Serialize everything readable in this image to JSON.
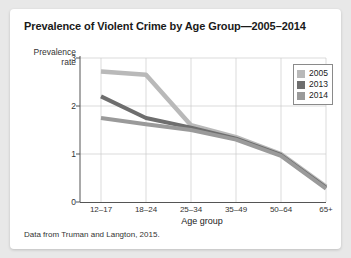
{
  "card": {
    "background": "#ffffff",
    "page_background": "#e8e8e8"
  },
  "title": "Prevalence of Violent Crime by Age Group—2005–2014",
  "source_note": "Data from Truman and Langton, 2015.",
  "axis": {
    "y_title_line1": "Prevalence",
    "y_title_line2": "rate",
    "x_title": "Age group",
    "y_ticks": [
      "0",
      "1",
      "2",
      "3"
    ],
    "x_ticks": [
      "12–17",
      "18–24",
      "25–34",
      "35–49",
      "50–64",
      "65+"
    ]
  },
  "legend": {
    "position": "top-right",
    "entries": [
      {
        "label": "2005",
        "color": "#b9b9b9"
      },
      {
        "label": "2013",
        "color": "#6e6e6e"
      },
      {
        "label": "2014",
        "color": "#9a9a9a"
      }
    ]
  },
  "chart_data": {
    "type": "line",
    "title": "Prevalence of Violent Crime by Age Group—2005–2014",
    "xlabel": "Age group",
    "ylabel": "Prevalence rate",
    "categories": [
      "12–17",
      "18–24",
      "25–34",
      "35–49",
      "50–64",
      "65+"
    ],
    "ylim": [
      0,
      3
    ],
    "yticks": [
      0,
      1,
      2,
      3
    ],
    "grid": true,
    "legend_position": "top-right",
    "series": [
      {
        "name": "2005",
        "color": "#b9b9b9",
        "values": [
          2.72,
          2.65,
          1.6,
          1.35,
          1.0,
          0.32
        ]
      },
      {
        "name": "2013",
        "color": "#6e6e6e",
        "values": [
          2.2,
          1.75,
          1.55,
          1.32,
          0.98,
          0.3
        ]
      },
      {
        "name": "2014",
        "color": "#9a9a9a",
        "values": [
          1.75,
          1.62,
          1.5,
          1.3,
          0.96,
          0.28
        ]
      }
    ]
  }
}
